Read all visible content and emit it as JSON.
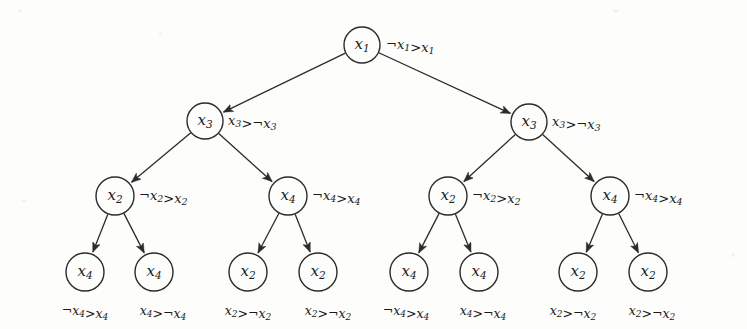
{
  "figure": {
    "type": "binary-decision-tree",
    "background_color": "#fdfdfc",
    "ink_color": "#1b1b1b",
    "width": 747,
    "height": 329
  },
  "nodes": [
    {
      "id": "root",
      "label_var": "x",
      "label_sub": "1",
      "annotation": {
        "left_var": "x",
        "left_sub": "1",
        "left_neg": true,
        "op": ">",
        "right_var": "x",
        "right_sub": "1",
        "right_neg": false
      },
      "cx": 362,
      "cy": 45,
      "r": 18,
      "annot_x": 386,
      "annot_y": 45
    },
    {
      "id": "l2a",
      "label_var": "x",
      "label_sub": "3",
      "annotation": {
        "left_var": "x",
        "left_sub": "3",
        "left_neg": false,
        "op": ">",
        "right_var": "x",
        "right_sub": "3",
        "right_neg": true
      },
      "cx": 205,
      "cy": 121,
      "r": 18,
      "annot_x": 228,
      "annot_y": 121
    },
    {
      "id": "l2b",
      "label_var": "x",
      "label_sub": "3",
      "annotation": {
        "left_var": "x",
        "left_sub": "3",
        "left_neg": false,
        "op": ">",
        "right_var": "x",
        "right_sub": "3",
        "right_neg": true
      },
      "cx": 529,
      "cy": 122,
      "r": 18,
      "annot_x": 552,
      "annot_y": 122
    },
    {
      "id": "l3a",
      "label_var": "x",
      "label_sub": "2",
      "annotation": {
        "left_var": "x",
        "left_sub": "2",
        "left_neg": true,
        "op": ">",
        "right_var": "x",
        "right_sub": "2",
        "right_neg": false
      },
      "cx": 115,
      "cy": 196,
      "r": 19,
      "annot_x": 139,
      "annot_y": 196
    },
    {
      "id": "l3b",
      "label_var": "x",
      "label_sub": "4",
      "annotation": {
        "left_var": "x",
        "left_sub": "4",
        "left_neg": true,
        "op": ">",
        "right_var": "x",
        "right_sub": "4",
        "right_neg": false
      },
      "cx": 288,
      "cy": 196,
      "r": 19,
      "annot_x": 312,
      "annot_y": 196
    },
    {
      "id": "l3c",
      "label_var": "x",
      "label_sub": "2",
      "annotation": {
        "left_var": "x",
        "left_sub": "2",
        "left_neg": true,
        "op": ">",
        "right_var": "x",
        "right_sub": "2",
        "right_neg": false
      },
      "cx": 448,
      "cy": 196,
      "r": 19,
      "annot_x": 472,
      "annot_y": 196
    },
    {
      "id": "l3d",
      "label_var": "x",
      "label_sub": "4",
      "annotation": {
        "left_var": "x",
        "left_sub": "4",
        "left_neg": true,
        "op": ">",
        "right_var": "x",
        "right_sub": "4",
        "right_neg": false
      },
      "cx": 610,
      "cy": 196,
      "r": 19,
      "annot_x": 634,
      "annot_y": 196
    }
  ],
  "leaves": [
    {
      "id": "leaf1",
      "label_var": "x",
      "label_sub": "4",
      "cx": 85,
      "cy": 272,
      "r": 19,
      "caption": {
        "left_var": "x",
        "left_sub": "4",
        "left_neg": true,
        "op": ">",
        "right_var": "x",
        "right_sub": "4",
        "right_neg": false
      },
      "caption_x": 85,
      "caption_y": 311
    },
    {
      "id": "leaf2",
      "label_var": "x",
      "label_sub": "4",
      "cx": 154,
      "cy": 272,
      "r": 19,
      "caption": {
        "left_var": "x",
        "left_sub": "4",
        "left_neg": false,
        "op": ">",
        "right_var": "x",
        "right_sub": "4",
        "right_neg": true
      },
      "caption_x": 163,
      "caption_y": 311
    },
    {
      "id": "leaf3",
      "label_var": "x",
      "label_sub": "2",
      "cx": 248,
      "cy": 272,
      "r": 19,
      "caption": {
        "left_var": "x",
        "left_sub": "2",
        "left_neg": false,
        "op": ">",
        "right_var": "x",
        "right_sub": "2",
        "right_neg": true
      },
      "caption_x": 248,
      "caption_y": 311
    },
    {
      "id": "leaf4",
      "label_var": "x",
      "label_sub": "2",
      "cx": 318,
      "cy": 272,
      "r": 19,
      "caption": {
        "left_var": "x",
        "left_sub": "2",
        "left_neg": false,
        "op": ">",
        "right_var": "x",
        "right_sub": "2",
        "right_neg": true
      },
      "caption_x": 328,
      "caption_y": 311
    },
    {
      "id": "leaf5",
      "label_var": "x",
      "label_sub": "4",
      "cx": 409,
      "cy": 272,
      "r": 19,
      "caption": {
        "left_var": "x",
        "left_sub": "4",
        "left_neg": true,
        "op": ">",
        "right_var": "x",
        "right_sub": "4",
        "right_neg": false
      },
      "caption_x": 406,
      "caption_y": 311
    },
    {
      "id": "leaf6",
      "label_var": "x",
      "label_sub": "4",
      "cx": 479,
      "cy": 272,
      "r": 19,
      "caption": {
        "left_var": "x",
        "left_sub": "4",
        "left_neg": false,
        "op": ">",
        "right_var": "x",
        "right_sub": "4",
        "right_neg": true
      },
      "caption_x": 483,
      "caption_y": 311
    },
    {
      "id": "leaf7",
      "label_var": "x",
      "label_sub": "2",
      "cx": 578,
      "cy": 272,
      "r": 19,
      "caption": {
        "left_var": "x",
        "left_sub": "2",
        "left_neg": false,
        "op": ">",
        "right_var": "x",
        "right_sub": "2",
        "right_neg": true
      },
      "caption_x": 573,
      "caption_y": 311
    },
    {
      "id": "leaf8",
      "label_var": "x",
      "label_sub": "2",
      "cx": 648,
      "cy": 272,
      "r": 19,
      "caption": {
        "left_var": "x",
        "left_sub": "2",
        "left_neg": false,
        "op": ">",
        "right_var": "x",
        "right_sub": "2",
        "right_neg": true
      },
      "caption_x": 652,
      "caption_y": 311
    }
  ],
  "edges": [
    {
      "from": "root",
      "to": "l2a"
    },
    {
      "from": "root",
      "to": "l2b"
    },
    {
      "from": "l2a",
      "to": "l3a"
    },
    {
      "from": "l2a",
      "to": "l3b"
    },
    {
      "from": "l2b",
      "to": "l3c"
    },
    {
      "from": "l2b",
      "to": "l3d"
    },
    {
      "from": "l3a",
      "to": "leaf1"
    },
    {
      "from": "l3a",
      "to": "leaf2"
    },
    {
      "from": "l3b",
      "to": "leaf3"
    },
    {
      "from": "l3b",
      "to": "leaf4"
    },
    {
      "from": "l3c",
      "to": "leaf5"
    },
    {
      "from": "l3c",
      "to": "leaf6"
    },
    {
      "from": "l3d",
      "to": "leaf7"
    },
    {
      "from": "l3d",
      "to": "leaf8"
    }
  ],
  "symbols": {
    "negation": "¬",
    "greater_than": ">"
  }
}
